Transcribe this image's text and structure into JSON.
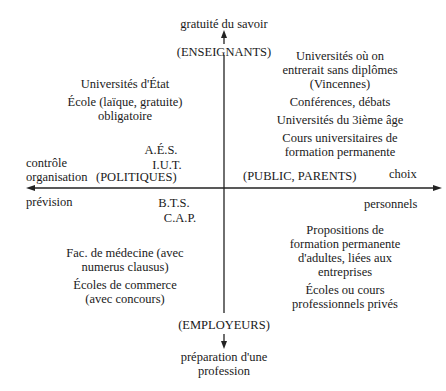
{
  "axes": {
    "top_label": "gratuité du savoir",
    "top_actor": "(ENSEIGNANTS)",
    "bottom_actor": "(EMPLOYEURS)",
    "bottom_label": "préparation d'une\nprofession",
    "left_label_top": "contrôle\norganisation",
    "left_label_bottom": "prévision",
    "left_actor": "(POLITIQUES)",
    "right_actor": "(PUBLIC, PARENTS)",
    "right_label_top": "choix",
    "right_label_bottom": "personnels"
  },
  "quadrants": {
    "top_left": [
      "Universités d'État",
      "École (laïque, gratuite)\nobligatoire"
    ],
    "top_right": [
      "Universités où on\nentrerait sans diplômes\n(Vincennes)",
      "Conférences, débats",
      "Universités du 3ième âge",
      "Cours universitaires de\nformation permanente"
    ],
    "near_axis_upper_left": [
      "A.É.S.",
      "I.U.T."
    ],
    "near_axis_lower_left": [
      "B.T.S.",
      "C.A.P."
    ],
    "bottom_left": [
      "Fac. de médecine (avec\nnumerus clausus)",
      "Écoles de commerce\n(avec concours)"
    ],
    "bottom_right": [
      "Propositions de\nformation permanente\nd'adultes, liées aux\nentreprises",
      "Écoles ou cours\nprofessionnels privés"
    ]
  }
}
